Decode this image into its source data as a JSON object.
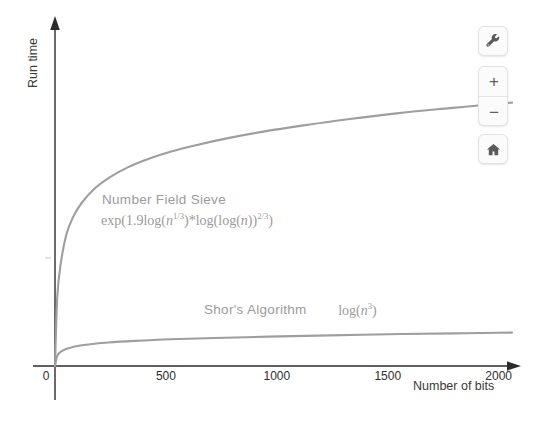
{
  "chart_data": {
    "type": "line",
    "title": "",
    "xlabel": "Number of bits",
    "ylabel": "Run time",
    "xlim": [
      0,
      2060
    ],
    "ylim": [
      0,
      1
    ],
    "grid": false,
    "legend_position": "inline-annotation",
    "xticks": [
      0,
      500,
      1000,
      1500,
      2000
    ],
    "xtick_labels": [
      "0",
      "500",
      "1000",
      "1500",
      "2000"
    ],
    "ytick_labels": [],
    "axis_style": "arrow-axes",
    "series": [
      {
        "name": "Number Field Sieve",
        "formula": "exp(1.9 log(n^(1/3)) * log(log(n))^(2/3))",
        "color": "#9e9e9e",
        "x": [
          0,
          10,
          25,
          50,
          80,
          120,
          180,
          250,
          330,
          420,
          520,
          640,
          780,
          940,
          1120,
          1320,
          1540,
          1780,
          2000,
          2060
        ],
        "y": [
          0.0,
          0.21,
          0.31,
          0.4,
          0.455,
          0.5,
          0.545,
          0.58,
          0.61,
          0.635,
          0.657,
          0.678,
          0.699,
          0.719,
          0.738,
          0.757,
          0.775,
          0.791,
          0.805,
          0.808
        ]
      },
      {
        "name": "Shor's Algorithm",
        "formula": "log(n^3)",
        "color": "#9e9e9e",
        "x": [
          0,
          10,
          25,
          50,
          90,
          150,
          240,
          360,
          520,
          720,
          960,
          1240,
          1560,
          1800,
          2000,
          2060
        ],
        "y": [
          0.0,
          0.031,
          0.043,
          0.052,
          0.06,
          0.066,
          0.072,
          0.077,
          0.082,
          0.086,
          0.09,
          0.094,
          0.098,
          0.1,
          0.102,
          0.1025
        ]
      }
    ],
    "annotations": [
      {
        "name": "nfs-annotation",
        "label": "Number Field Sieve",
        "formula_parts": {
          "open": "exp(1.9",
          "log1": "log(",
          "var1": "n",
          "sup1": "1/3",
          "close1": ")",
          "mult": "*",
          "log2": "log(log(",
          "var2": "n",
          "close2": "))",
          "sup2": "2/3",
          "close3": ")"
        }
      },
      {
        "name": "shor-annotation",
        "label": "Shor's Algorithm",
        "formula_parts": {
          "log": "log(",
          "var": "n",
          "sup": "3",
          "close": ")"
        }
      }
    ]
  },
  "map_controls": {
    "wrench": {
      "name": "settings-wrench-button",
      "label": ""
    },
    "zoom_in": {
      "name": "zoom-in-button",
      "label": "+"
    },
    "zoom_out": {
      "name": "zoom-out-button",
      "label": "−"
    },
    "home": {
      "name": "home-button",
      "label": ""
    }
  }
}
